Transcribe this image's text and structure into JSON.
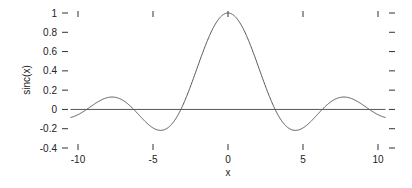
{
  "chart_data": {
    "type": "line",
    "title": "",
    "xlabel": "x",
    "ylabel": "sinc(x)",
    "xlim": [
      -10.5,
      10.5
    ],
    "ylim": [
      -0.4,
      1.0
    ],
    "x_ticks": [
      -10,
      -5,
      0,
      5,
      10
    ],
    "x_tick_labels": [
      "-10",
      "-5",
      "0",
      "5",
      "10"
    ],
    "y_ticks": [
      -0.4,
      -0.2,
      0,
      0.2,
      0.4,
      0.6,
      0.8,
      1
    ],
    "y_tick_labels": [
      "-0.4",
      "-0.2",
      "0",
      "0.2",
      "0.4",
      "0.6",
      "0.8",
      "1"
    ],
    "grid": false,
    "legend": null,
    "zero_line": true,
    "series": [
      {
        "name": "sinc(x)",
        "function": "sin(x)/x",
        "x_range": [
          -10.5,
          10.5
        ],
        "key_points": [
          {
            "x": 0,
            "y": 1.0
          },
          {
            "x": -4.49,
            "y": -0.217
          },
          {
            "x": 4.49,
            "y": -0.217
          },
          {
            "x": -7.73,
            "y": 0.128
          },
          {
            "x": 7.73,
            "y": 0.128
          },
          {
            "x": -10.9,
            "y": -0.091
          },
          {
            "x": 10.9,
            "y": -0.091
          }
        ]
      }
    ],
    "colors": {
      "line": "#555555",
      "axis": "#333333",
      "text": "#222222"
    }
  }
}
